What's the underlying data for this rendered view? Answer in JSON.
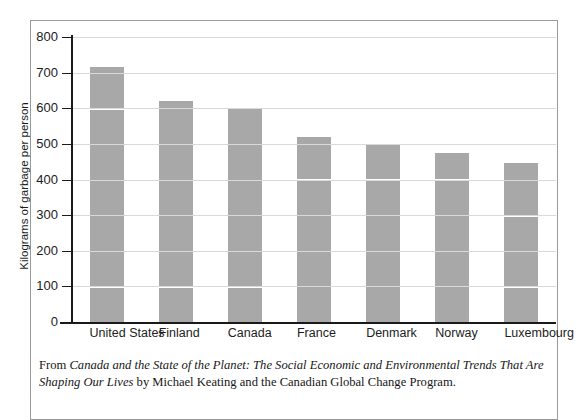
{
  "chart_data": {
    "type": "bar",
    "title": "",
    "subtitle": "",
    "xlabel": "",
    "ylabel": "Kilograms of garbage per person",
    "categories": [
      "United States",
      "Finland",
      "Canada",
      "France",
      "Denmark",
      "Norway",
      "Luxembourg"
    ],
    "values": [
      715,
      620,
      600,
      520,
      500,
      475,
      445
    ],
    "ylim": [
      0,
      800
    ],
    "yticks": [
      0,
      100,
      200,
      300,
      400,
      500,
      600,
      700,
      800
    ],
    "ytick_labels": [
      "0",
      "100",
      "200",
      "300",
      "400",
      "500",
      "600",
      "700",
      "800"
    ],
    "grid": true,
    "grid_axis": "y",
    "legend": false,
    "legend_position": "none",
    "bar_color": "#a8a8a8",
    "gridline_color": "#d9d9d9",
    "axis_color": "#1a1a1a"
  },
  "caption": {
    "lead": "From ",
    "book_title": "Canada and the State of the Planet: The Social Economic and Environmental Trends That Are Shaping Our Lives",
    "trail": " by Michael Keating and the Canadian Global Change Program."
  },
  "colors": {
    "bar": "#a8a8a8",
    "grid": "#d9d9d9",
    "grid_over_bar": "#ffffff",
    "axis": "#1a1a1a",
    "frame": "#9a9a9a",
    "text": "#1c1c1c",
    "background": "#ffffff"
  }
}
